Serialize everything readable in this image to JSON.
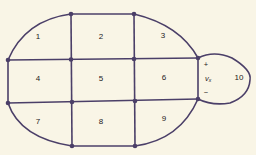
{
  "diagram": {
    "type": "circuit-mesh-graph",
    "colors": {
      "background": "#f9f5e6",
      "line": "#4b3f68",
      "text": "#1e1a22"
    },
    "meshes": [
      {
        "id": "1",
        "label": "1"
      },
      {
        "id": "2",
        "label": "2"
      },
      {
        "id": "3",
        "label": "3"
      },
      {
        "id": "4",
        "label": "4"
      },
      {
        "id": "5",
        "label": "5"
      },
      {
        "id": "6",
        "label": "6"
      },
      {
        "id": "7",
        "label": "7"
      },
      {
        "id": "8",
        "label": "8"
      },
      {
        "id": "9",
        "label": "9"
      },
      {
        "id": "10",
        "label": "10"
      }
    ],
    "source": {
      "name": "v",
      "subscript": "x",
      "plus": "+",
      "minus": "−"
    }
  }
}
